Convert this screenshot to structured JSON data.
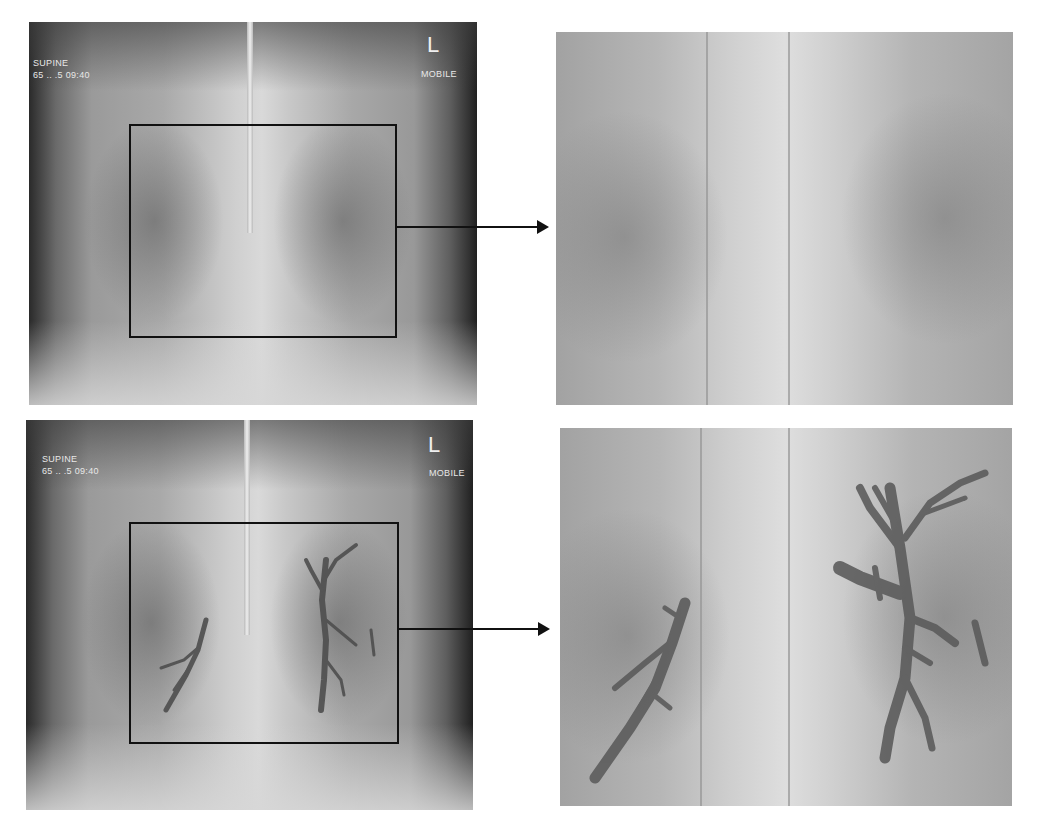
{
  "figure": {
    "panels": [
      {
        "id": "top-left",
        "kind": "chest-xray-original",
        "overlay": {
          "position_label": "SUPINE",
          "date_time": "65 .. .5 09:40",
          "side_marker": "L",
          "modality": "MOBILE"
        },
        "roi_box": true
      },
      {
        "id": "top-right",
        "kind": "magnified-roi"
      },
      {
        "id": "bottom-left",
        "kind": "chest-xray-annotated",
        "overlay": {
          "position_label": "SUPINE",
          "date_time": "65 .. .5 09:40",
          "side_marker": "L",
          "modality": "MOBILE"
        },
        "roi_box": true,
        "annotation": "dark branching structures (air bronchograms) highlighted"
      },
      {
        "id": "bottom-right",
        "kind": "magnified-roi-annotated",
        "annotation": "dark branching structures (air bronchograms) highlighted"
      }
    ],
    "colors": {
      "annotation": "#5a5a5a",
      "box": "#111111",
      "background": "#ffffff"
    }
  }
}
